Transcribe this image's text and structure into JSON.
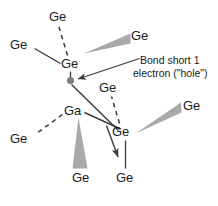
{
  "figure": {
    "background_color": "#ffffff",
    "text_color": "#1a1a1a",
    "bond_color": "#3a3a3a",
    "wedge_color": "#a9a9a9",
    "hole_color": "#7d7d7d",
    "width": 218,
    "height": 206
  },
  "annotation": {
    "line1": "Bond short 1",
    "line2": "electron (\"hole\")"
  },
  "atoms": [
    {
      "id": "ge-top",
      "label": "Ge",
      "x": 49,
      "y": 10
    },
    {
      "id": "ge-upper-left",
      "label": "Ge",
      "x": 10,
      "y": 38
    },
    {
      "id": "ge-center",
      "label": "Ge",
      "x": 61,
      "y": 57
    },
    {
      "id": "ge-upper-right",
      "label": "Ge",
      "x": 131,
      "y": 29
    },
    {
      "id": "ge-mid-right",
      "label": "Ge",
      "x": 99,
      "y": 81
    },
    {
      "id": "ga-dopant",
      "label": "Ga",
      "x": 64,
      "y": 104
    },
    {
      "id": "ge-left-lower",
      "label": "Ge",
      "x": 10,
      "y": 132
    },
    {
      "id": "ge-lower-right",
      "label": "Ge",
      "x": 112,
      "y": 125
    },
    {
      "id": "ge-far-right",
      "label": "Ge",
      "x": 183,
      "y": 99
    },
    {
      "id": "ge-bottom-left",
      "label": "Ge",
      "x": 72,
      "y": 171
    },
    {
      "id": "ge-bottom-right",
      "label": "Ge",
      "x": 116,
      "y": 171
    }
  ],
  "hole": {
    "label": "hole-electron-marker",
    "cx": 70.5,
    "cy": 80.5,
    "r": 3.6
  }
}
